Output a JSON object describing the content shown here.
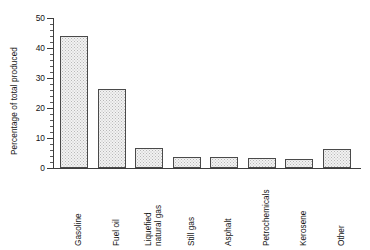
{
  "chart_data": {
    "type": "bar",
    "title": "",
    "xlabel": "",
    "ylabel": "Percentage of total produced",
    "ylim": [
      0,
      50
    ],
    "ytick_values": [
      0,
      10,
      20,
      30,
      40,
      50
    ],
    "ytick_labels": [
      "0",
      "10",
      "20",
      "30",
      "40",
      "50"
    ],
    "yminor_step": 2,
    "grid": false,
    "legend": null,
    "categories": [
      "Gasoline",
      "Fuel oil",
      "Liquefied natural gas",
      "Still gas",
      "Asphalt",
      "Petrochemicals",
      "Kerosene",
      "Other"
    ],
    "category_lines": [
      [
        "Gasoline"
      ],
      [
        "Fuel oil"
      ],
      [
        "Liquefied",
        "natural gas"
      ],
      [
        "Still gas"
      ],
      [
        "Asphalt"
      ],
      [
        "Petrochemicals"
      ],
      [
        "Kerosene"
      ],
      [
        "Other"
      ]
    ],
    "values": [
      44,
      26.5,
      6.7,
      3.8,
      3.8,
      3.3,
      3.0,
      6.5
    ],
    "bar_fill": "#f2f2f2",
    "bar_edge": "#4a4a4a",
    "axis_color": "#3d3d3d",
    "text_color": "#141414",
    "background": "#ffffff"
  }
}
